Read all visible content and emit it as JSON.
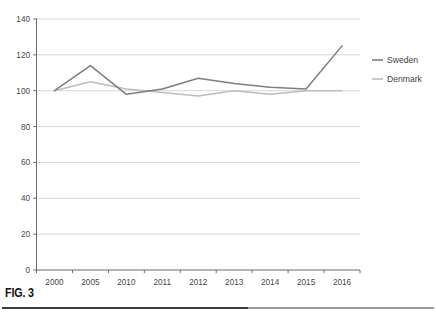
{
  "figure": {
    "caption": "FIG. 3"
  },
  "chart_data": {
    "type": "line",
    "title": "",
    "subtitle": "",
    "xlabel": "",
    "ylabel": "",
    "categories": [
      "2000",
      "2005",
      "2010",
      "2011",
      "2012",
      "2013",
      "2014",
      "2015",
      "2016"
    ],
    "series": [
      {
        "name": "Sweden",
        "color": "#7d7d7d",
        "values": [
          100,
          114,
          98,
          101,
          107,
          104,
          102,
          101,
          125
        ]
      },
      {
        "name": "Denmark",
        "color": "#bcbcbc",
        "values": [
          100,
          105,
          101,
          99,
          97,
          100,
          98,
          100,
          100
        ]
      }
    ],
    "ylim": [
      0,
      140
    ],
    "yticks": [
      0,
      20,
      40,
      60,
      80,
      100,
      120,
      140
    ],
    "ytick_labels": [
      "0",
      "20",
      "40",
      "60",
      "80",
      "100",
      "120",
      "140"
    ],
    "grid": true,
    "grid_color": "#d4d4d4",
    "axis_color": "#6b6b6b",
    "legend_position": "right",
    "legend": [
      "Sweden",
      "Denmark"
    ]
  }
}
